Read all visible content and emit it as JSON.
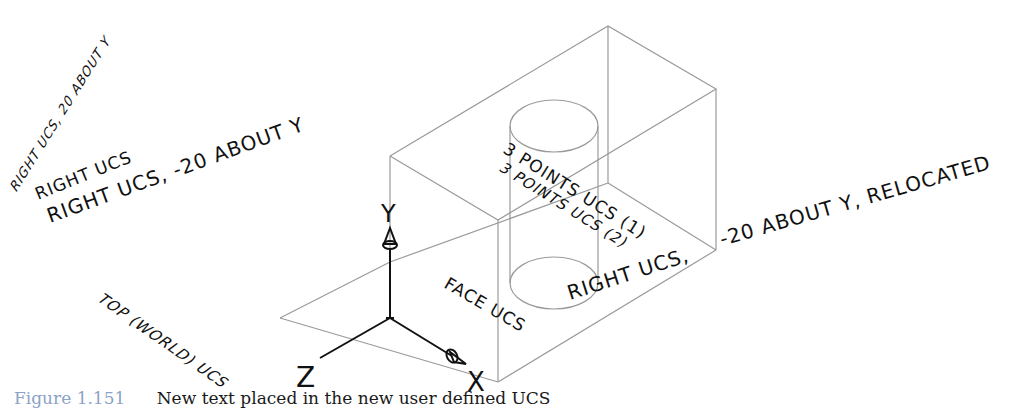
{
  "figure": {
    "label": "Figure 1.151",
    "caption": "New text placed in the new user defined UCS"
  },
  "colors": {
    "box_lines": "#9a9a9a",
    "axis_lines": "#111111",
    "text": "#111111",
    "caption_label": "#8aa3c8"
  },
  "labels": {
    "right_ucs_20_about_y": "RIGHT UCS, 20 ABOUT Y",
    "right_ucs": "RIGHT UCS",
    "right_ucs_minus20_about_y": "RIGHT UCS, -20 ABOUT Y",
    "three_points_ucs_1": "3 POINTS UCS (1)",
    "three_points_ucs_2": "3 POINTS UCS (2)",
    "right_ucs_minus20_relocated_a": "RIGHT UCS,",
    "right_ucs_minus20_relocated_b": "-20 ABOUT Y, RELOCATED",
    "face_ucs": "FACE UCS",
    "top_world_ucs": "TOP (WORLD) UCS"
  },
  "axes": {
    "x": "X",
    "y": "Y",
    "z": "Z"
  }
}
